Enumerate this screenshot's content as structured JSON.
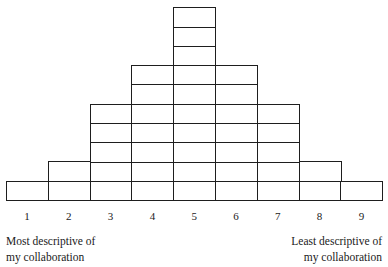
{
  "diagram": {
    "type": "q-sort-forced-distribution-grid",
    "columns": [
      {
        "label": "1",
        "boxes": 1
      },
      {
        "label": "2",
        "boxes": 2
      },
      {
        "label": "3",
        "boxes": 5
      },
      {
        "label": "4",
        "boxes": 7
      },
      {
        "label": "5",
        "boxes": 10
      },
      {
        "label": "6",
        "boxes": 7
      },
      {
        "label": "7",
        "boxes": 5
      },
      {
        "label": "8",
        "boxes": 2
      },
      {
        "label": "9",
        "boxes": 1
      }
    ],
    "total_boxes": 40,
    "left_caption": {
      "line1": "Most descriptive of",
      "line2": "my collaboration"
    },
    "right_caption": {
      "line1": "Least descriptive of",
      "line2": "my collaboration"
    },
    "line_color": "#1e1e1e"
  }
}
